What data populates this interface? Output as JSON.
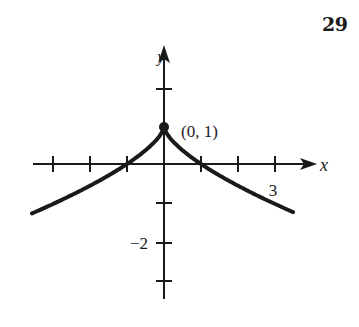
{
  "problem": {
    "number": "29"
  },
  "chart_data": {
    "type": "line",
    "title": "",
    "function": "y = 1 - |x|^(2/3)",
    "xlabel": "x",
    "ylabel": "y",
    "xlim": [
      -3.6,
      4.1
    ],
    "ylim": [
      -3.6,
      3.2
    ],
    "x_ticks": [
      -3,
      -2,
      -1,
      1,
      2,
      3
    ],
    "y_ticks": [
      2,
      1,
      -1,
      -2,
      -3
    ],
    "x_tick_labels": [
      {
        "value": 3,
        "label": "3"
      }
    ],
    "y_tick_labels": [
      {
        "value": -2,
        "label": "−2"
      }
    ],
    "grid": false,
    "series": [
      {
        "name": "curve",
        "x": [
          -3.57,
          -3,
          -2,
          -1,
          -0.5,
          0,
          0.5,
          1,
          2,
          3,
          3.49
        ],
        "y": [
          -1.34,
          -1.08,
          -0.59,
          0,
          0.37,
          1,
          0.37,
          0,
          -0.59,
          -1.08,
          -1.3
        ]
      }
    ],
    "annotations": [
      {
        "point": [
          0,
          1
        ],
        "label": "(0, 1)",
        "marker": "dot"
      }
    ]
  },
  "labels": {
    "x_axis": "x",
    "y_axis": "y",
    "point": "(0, 1)",
    "tick_x3": "3",
    "tick_yneg2": "−2"
  },
  "colors": {
    "ink": "#1a1a1a",
    "background": "#ffffff"
  }
}
